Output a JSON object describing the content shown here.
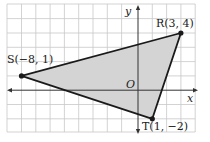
{
  "diagram": {
    "type": "coordinate-plane-triangle",
    "axes": {
      "x_label": "x",
      "y_label": "y",
      "origin_label": "O"
    },
    "points": [
      {
        "name": "R",
        "label": "R(3, 4)",
        "x": 3,
        "y": 4
      },
      {
        "name": "S",
        "label": "S(−8, 1)",
        "x": -8,
        "y": 1
      },
      {
        "name": "T",
        "label": "T(1, −2)",
        "x": 1,
        "y": -2
      }
    ],
    "grid": {
      "x_min": -9,
      "x_max": 4,
      "y_min": -3,
      "y_max": 6
    },
    "colors": {
      "fill": "#d4d4d4",
      "grid": "#c8c8c8",
      "stroke": "#1a1a1a"
    }
  }
}
